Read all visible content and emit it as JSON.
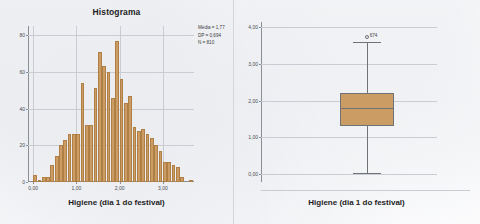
{
  "chart_data": [
    {
      "type": "bar",
      "id": "histogram",
      "title": "Histograma",
      "xlabel": "Higiene (dia 1 do festival)",
      "ylabel": "",
      "xlim": [
        -0.12,
        3.72
      ],
      "ylim": [
        0,
        85
      ],
      "grid": true,
      "legend": "none",
      "xticks": [
        "0,00",
        "1,00",
        "2,00",
        "3,00"
      ],
      "xtick_values": [
        0.0,
        1.0,
        2.0,
        3.0
      ],
      "yticks": [
        "0",
        "20",
        "40",
        "60",
        "80"
      ],
      "ytick_values": [
        0,
        20,
        40,
        60,
        80
      ],
      "bin_width": 0.1,
      "bin_centers": [
        0.05,
        0.15,
        0.25,
        0.35,
        0.45,
        0.55,
        0.65,
        0.75,
        0.85,
        0.95,
        1.05,
        1.15,
        1.25,
        1.35,
        1.45,
        1.55,
        1.65,
        1.75,
        1.85,
        1.95,
        2.05,
        2.15,
        2.25,
        2.35,
        2.45,
        2.55,
        2.65,
        2.75,
        2.85,
        2.95,
        3.05,
        3.15,
        3.25,
        3.35,
        3.45,
        3.55,
        3.65
      ],
      "values": [
        4,
        1,
        3,
        3,
        9,
        14,
        20,
        23,
        26,
        26,
        26,
        54,
        31,
        31,
        51,
        71,
        63,
        60,
        46,
        77,
        56,
        43,
        47,
        30,
        28,
        29,
        26,
        24,
        20,
        17,
        11,
        11,
        9,
        8,
        3,
        0,
        1
      ],
      "annotations": {
        "mean_label": "Média = 1,77",
        "sd_label": "DP = 0,694",
        "n_label": "N = 810",
        "mean": 1.77,
        "sd": 0.694,
        "n": 810
      },
      "bar_color": "#cb9c63",
      "bar_edge_color": "#b07f45"
    },
    {
      "type": "boxplot",
      "id": "boxplot",
      "title": "",
      "xlabel": "Higiene (dia 1 do festival)",
      "ylabel": "",
      "ylim": [
        -0.22,
        4.15
      ],
      "grid": true,
      "legend": "none",
      "yticks": [
        "0,00",
        "1,00",
        "2,00",
        "3,00",
        "4,00"
      ],
      "ytick_values": [
        0.0,
        1.0,
        2.0,
        3.0,
        4.0
      ],
      "category": "Higiene (dia 1 do festival)",
      "box": {
        "whisker_low": 0.02,
        "q1": 1.3,
        "median": 1.8,
        "q3": 2.21,
        "whisker_high": 3.61
      },
      "outliers": [
        {
          "label": "674",
          "value": 3.73
        }
      ],
      "box_color": "#cb9c63",
      "box_edge_color": "#6f7277"
    }
  ],
  "theme": {
    "background": "#fbfcfd",
    "grid_color": "#c9ccd2",
    "axis_color": "#8b8e94",
    "text_color": "#1d1d1f",
    "accent": "#cb9c63"
  }
}
